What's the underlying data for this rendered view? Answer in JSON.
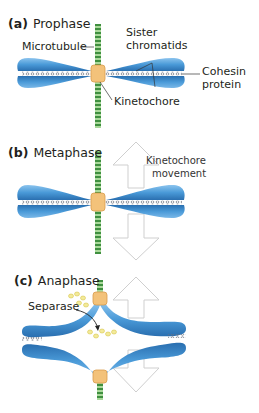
{
  "panels": [
    {
      "letter": "(a)",
      "title": "Prophase",
      "labels": {
        "microtubule": "Microtubule",
        "sister_chromatids_line1": "Sister",
        "sister_chromatids_line2": "chromatids",
        "cohesin_line1": "Cohesin",
        "cohesin_line2": "protein",
        "kinetochore": "Kinetochore"
      }
    },
    {
      "letter": "(b)",
      "title": "Metaphase",
      "labels": {
        "movement_line1": "Kinetochore",
        "movement_line2": "movement"
      }
    },
    {
      "letter": "(c)",
      "title": "Anaphase",
      "labels": {
        "separase": "Separase"
      }
    }
  ],
  "colors": {
    "chromatid": "#4a9ad8",
    "chromatid_light": "#8cc4ee",
    "chromatid_dark": "#2a6fb0",
    "cohesin": "#7a7f8a",
    "kinetochore": "#f3c27a",
    "microtubule_green": "#4fa04a",
    "separase": "#efe27a",
    "arrow_outline": "#cfcfcf"
  }
}
